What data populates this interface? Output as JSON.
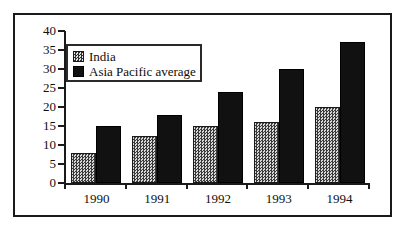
{
  "chart_data": {
    "type": "bar",
    "title": "",
    "subtitle": "",
    "xlabel": "",
    "ylabel": "",
    "categories": [
      "1990",
      "1991",
      "1992",
      "1993",
      "1994"
    ],
    "series": [
      {
        "name": "India",
        "values": [
          8,
          12.5,
          15,
          16,
          20
        ],
        "color": "#8f8f8f",
        "fill": "checkered-gray"
      },
      {
        "name": "Asia Pacific average",
        "values": [
          15,
          18,
          24,
          30,
          37
        ],
        "color": "#111111",
        "fill": "solid-black"
      }
    ],
    "ylim": [
      0,
      40
    ],
    "ytick_labels": [
      "0",
      "5",
      "10",
      "15",
      "20",
      "25",
      "30",
      "35",
      "40"
    ],
    "ytick_values": [
      0,
      5,
      10,
      15,
      20,
      25,
      30,
      35,
      40
    ],
    "grid": false,
    "legend_position": "top-left",
    "legend_entries": [
      "India",
      "Asia Pacific average"
    ],
    "annotations": []
  },
  "figure": {
    "frame_color": "#1a1a1a",
    "background": "#ffffff",
    "axis_color": "#1a1a1a"
  }
}
